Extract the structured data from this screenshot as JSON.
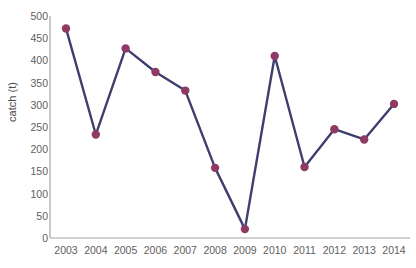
{
  "chart_data": {
    "type": "line",
    "title": "",
    "xlabel": "",
    "ylabel": "catch (t)",
    "categories": [
      "2003",
      "2004",
      "2005",
      "2006",
      "2007",
      "2008",
      "2009",
      "2010",
      "2011",
      "2012",
      "2013",
      "2014"
    ],
    "values": [
      472,
      233,
      427,
      374,
      332,
      158,
      20,
      410,
      160,
      245,
      222,
      302
    ],
    "series": [
      {
        "name": "catch",
        "values": [
          472,
          233,
          427,
          374,
          332,
          158,
          20,
          410,
          160,
          245,
          222,
          302
        ]
      }
    ],
    "ylim": [
      0,
      500
    ],
    "ytick_labels": [
      "0",
      "50",
      "100",
      "150",
      "200",
      "250",
      "300",
      "350",
      "400",
      "450",
      "500"
    ],
    "ytick_values": [
      0,
      50,
      100,
      150,
      200,
      250,
      300,
      350,
      400,
      450,
      500
    ],
    "grid": false,
    "legend": false,
    "legend_position": "none",
    "line_color": "#3e3f6e",
    "marker_color": "#8e3a62",
    "marker_shape": "circle",
    "axis_color": "#a6a6a6",
    "text_color": "#606060",
    "background_color": "#ffffff"
  }
}
